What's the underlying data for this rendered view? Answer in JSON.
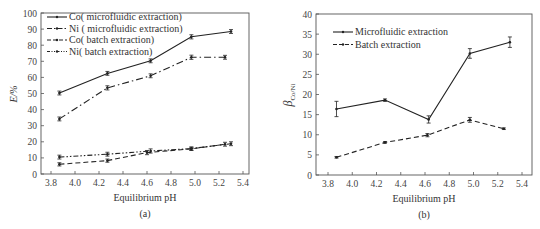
{
  "chart_data": [
    {
      "id": "a",
      "type": "line",
      "caption": "(a)",
      "xlabel": "Equilibrium pH",
      "ylabel": "E/%",
      "xlim": [
        3.7,
        5.5
      ],
      "ylim": [
        0,
        100
      ],
      "xticks": [
        "3.8",
        "4.0",
        "4.2",
        "4.4",
        "4.6",
        "4.8",
        "5.0",
        "5.2",
        "5.4"
      ],
      "yticks": [
        "0",
        "10",
        "20",
        "30",
        "40",
        "50",
        "60",
        "70",
        "80",
        "90",
        "100"
      ],
      "grid": false,
      "legend_position": "upper-left",
      "series": [
        {
          "name": "Co( microfluidic extraction)",
          "style": "solid",
          "x": [
            3.87,
            4.27,
            4.63,
            4.97,
            5.3
          ],
          "y": [
            50.3,
            62.5,
            70.3,
            85.2,
            88.5
          ],
          "err": [
            1.2,
            1.2,
            1.2,
            1.3,
            1.2
          ]
        },
        {
          "name": "Ni ( microfluidic extraction)",
          "style": "dashdot",
          "x": [
            3.87,
            4.27,
            4.63,
            4.97,
            5.25
          ],
          "y": [
            34.2,
            53.5,
            61.0,
            72.5,
            72.5
          ],
          "err": [
            1.2,
            1.3,
            1.2,
            1.3,
            1.2
          ]
        },
        {
          "name": "Co( batch extraction)",
          "style": "dashed",
          "x": [
            3.87,
            4.27,
            4.6,
            4.97,
            5.25
          ],
          "y": [
            6.0,
            8.3,
            13.3,
            15.6,
            18.5
          ],
          "err": [
            1.0,
            1.0,
            1.3,
            1.0,
            1.2
          ]
        },
        {
          "name": "Ni( batch extraction)",
          "style": "dashdotdot",
          "x": [
            3.87,
            4.27,
            4.63,
            4.97,
            5.3
          ],
          "y": [
            10.5,
            12.3,
            14.3,
            15.8,
            18.8
          ],
          "err": [
            1.2,
            1.2,
            1.3,
            1.0,
            1.2
          ]
        }
      ]
    },
    {
      "id": "b",
      "type": "line",
      "caption": "(b)",
      "xlabel": "Equilibrium pH",
      "ylabel": "β",
      "ylabel_sub": "Co/Ni",
      "xlim": [
        3.7,
        5.5
      ],
      "ylim": [
        0,
        40
      ],
      "xticks": [
        "3.8",
        "4.0",
        "4.2",
        "4.4",
        "4.6",
        "4.8",
        "5.0",
        "5.2",
        "5.4"
      ],
      "yticks": [
        "0",
        "5",
        "10",
        "15",
        "20",
        "25",
        "30",
        "35",
        "40"
      ],
      "grid": false,
      "legend_position": "upper-left",
      "series": [
        {
          "name": "Microfluidic extraction",
          "style": "solid",
          "x": [
            3.87,
            4.27,
            4.63,
            4.97,
            5.3
          ],
          "y": [
            16.4,
            18.6,
            13.8,
            30.2,
            33.0
          ],
          "err": [
            1.9,
            0.3,
            0.9,
            1.2,
            1.3
          ]
        },
        {
          "name": "Batch extraction",
          "style": "dashed",
          "x": [
            3.87,
            4.27,
            4.62,
            4.97,
            5.25
          ],
          "y": [
            4.4,
            8.1,
            9.9,
            13.7,
            11.5
          ],
          "err": [
            0.2,
            0.2,
            0.4,
            0.6,
            0.2
          ]
        }
      ]
    }
  ]
}
